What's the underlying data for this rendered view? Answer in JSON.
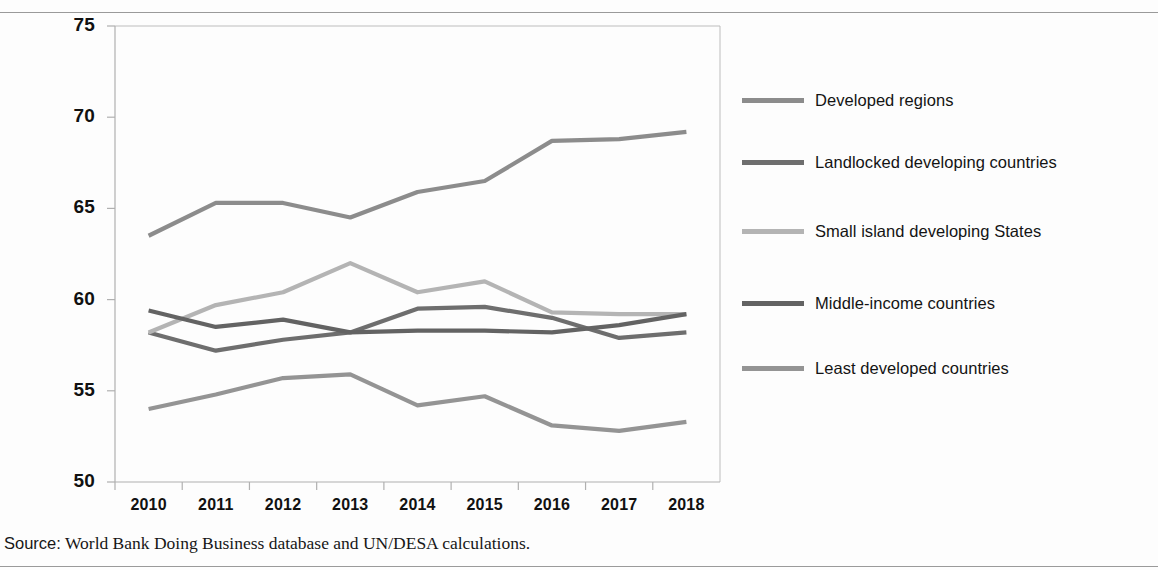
{
  "figure": {
    "source_keyword": "Source:",
    "source_text": "World Bank Doing Business database and UN/DESA calculations."
  },
  "axes": {
    "y_ticks": [
      "75",
      "70",
      "65",
      "60",
      "55",
      "50"
    ],
    "x_ticks": [
      "2010",
      "2011",
      "2012",
      "2013",
      "2014",
      "2015",
      "2016",
      "2017",
      "2018"
    ]
  },
  "legend": {
    "position": "right",
    "items": [
      {
        "label": "Developed regions",
        "color": "#8c8c8c"
      },
      {
        "label": "Landlocked developing countries",
        "color": "#6e6e6e"
      },
      {
        "label": "Small island developing States",
        "color": "#b4b4b4"
      },
      {
        "label": "Middle-income countries",
        "color": "#636363"
      },
      {
        "label": "Least developed countries",
        "color": "#949494"
      }
    ]
  },
  "chart_data": {
    "type": "line",
    "title": "",
    "xlabel": "",
    "ylabel": "",
    "xlim": [
      2010,
      2018
    ],
    "ylim": [
      50,
      75
    ],
    "grid": false,
    "legend_position": "right",
    "x": [
      2010,
      2011,
      2012,
      2013,
      2014,
      2015,
      2016,
      2017,
      2018
    ],
    "categories": [
      "2010",
      "2011",
      "2012",
      "2013",
      "2014",
      "2015",
      "2016",
      "2017",
      "2018"
    ],
    "series": [
      {
        "name": "Developed regions",
        "color": "#8c8c8c",
        "values": [
          63.5,
          65.3,
          65.3,
          64.5,
          65.9,
          66.5,
          68.7,
          68.8,
          69.2
        ]
      },
      {
        "name": "Landlocked developing countries",
        "color": "#6e6e6e",
        "values": [
          58.2,
          57.2,
          57.8,
          58.2,
          59.5,
          59.6,
          59.0,
          57.9,
          58.2
        ]
      },
      {
        "name": "Small island developing States",
        "color": "#b4b4b4",
        "values": [
          58.2,
          59.7,
          60.4,
          62.0,
          60.4,
          61.0,
          59.3,
          59.2,
          59.2
        ]
      },
      {
        "name": "Middle-income countries",
        "color": "#636363",
        "values": [
          59.4,
          58.5,
          58.9,
          58.2,
          58.3,
          58.3,
          58.2,
          58.6,
          59.2
        ]
      },
      {
        "name": "Least developed countries",
        "color": "#949494",
        "values": [
          54.0,
          54.8,
          55.7,
          55.9,
          54.2,
          54.7,
          53.1,
          52.8,
          53.3
        ]
      }
    ]
  }
}
